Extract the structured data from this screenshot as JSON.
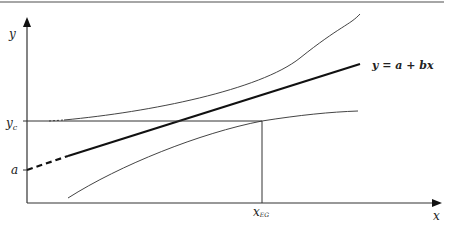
{
  "diagram": {
    "labels": {
      "y_axis": "y",
      "x_axis": "x",
      "yc_main": "y",
      "yc_sub": "c",
      "a": "a",
      "xeg_main": "x",
      "xeg_sub": "EG",
      "equation": "y = a + bx"
    },
    "elements": [
      "regression line",
      "upper confidence band",
      "lower confidence band",
      "critical value yc reference",
      "x_EG projection"
    ]
  }
}
